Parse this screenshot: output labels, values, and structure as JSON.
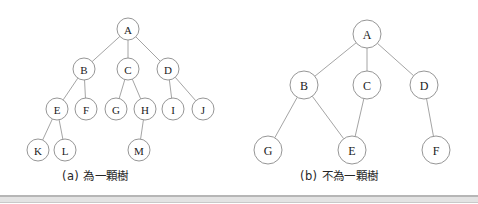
{
  "figure": {
    "background_color": "#ffffff",
    "node_stroke_color": "#8a8a8a",
    "edge_stroke_color": "#9a9a9a",
    "label_color": "#1b1b1b",
    "rule_color": "#b6b6b6"
  },
  "panels": [
    {
      "id": "a",
      "caption": "(a) 為一顆樹",
      "node_radius": 11,
      "label_font_size": 11,
      "nodes": [
        {
          "id": "A",
          "label": "A",
          "x": 128,
          "y": 29
        },
        {
          "id": "B",
          "label": "B",
          "x": 84,
          "y": 69
        },
        {
          "id": "C",
          "label": "C",
          "x": 128,
          "y": 69
        },
        {
          "id": "D",
          "label": "D",
          "x": 168,
          "y": 69
        },
        {
          "id": "E",
          "label": "E",
          "x": 57,
          "y": 109
        },
        {
          "id": "F",
          "label": "F",
          "x": 86,
          "y": 109
        },
        {
          "id": "G",
          "label": "G",
          "x": 116,
          "y": 109
        },
        {
          "id": "H",
          "label": "H",
          "x": 145,
          "y": 109
        },
        {
          "id": "I",
          "label": "I",
          "x": 173,
          "y": 109
        },
        {
          "id": "J",
          "label": "J",
          "x": 203,
          "y": 109
        },
        {
          "id": "K",
          "label": "K",
          "x": 38,
          "y": 150
        },
        {
          "id": "L",
          "label": "L",
          "x": 65,
          "y": 150
        },
        {
          "id": "M",
          "label": "M",
          "x": 139,
          "y": 150
        }
      ],
      "edges": [
        {
          "from": "A",
          "to": "B"
        },
        {
          "from": "A",
          "to": "C"
        },
        {
          "from": "A",
          "to": "D"
        },
        {
          "from": "B",
          "to": "E"
        },
        {
          "from": "B",
          "to": "F"
        },
        {
          "from": "C",
          "to": "G"
        },
        {
          "from": "C",
          "to": "H"
        },
        {
          "from": "D",
          "to": "I"
        },
        {
          "from": "D",
          "to": "J"
        },
        {
          "from": "E",
          "to": "K"
        },
        {
          "from": "E",
          "to": "L"
        },
        {
          "from": "H",
          "to": "M"
        }
      ]
    },
    {
      "id": "b",
      "caption": "(b) 不為一顆樹",
      "node_radius": 14,
      "label_font_size": 12,
      "nodes": [
        {
          "id": "A",
          "label": "A",
          "x": 367,
          "y": 34
        },
        {
          "id": "B",
          "label": "B",
          "x": 304,
          "y": 85
        },
        {
          "id": "C",
          "label": "C",
          "x": 367,
          "y": 85
        },
        {
          "id": "D",
          "label": "D",
          "x": 424,
          "y": 85
        },
        {
          "id": "G",
          "label": "G",
          "x": 268,
          "y": 150
        },
        {
          "id": "E",
          "label": "E",
          "x": 352,
          "y": 150
        },
        {
          "id": "F",
          "label": "F",
          "x": 436,
          "y": 150
        }
      ],
      "edges": [
        {
          "from": "A",
          "to": "B"
        },
        {
          "from": "A",
          "to": "C"
        },
        {
          "from": "A",
          "to": "D"
        },
        {
          "from": "B",
          "to": "G"
        },
        {
          "from": "B",
          "to": "E"
        },
        {
          "from": "C",
          "to": "E"
        },
        {
          "from": "D",
          "to": "F"
        }
      ]
    }
  ]
}
